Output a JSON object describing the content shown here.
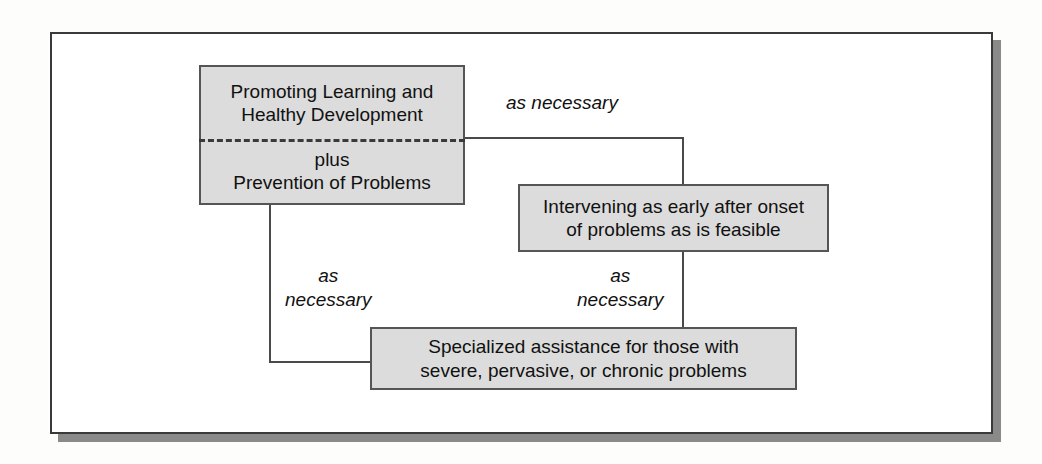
{
  "diagram": {
    "type": "flow-diagram",
    "title": "",
    "nodes": [
      {
        "id": "promoting-learning",
        "upper_lines": [
          "Promoting Learning and",
          "Healthy Development"
        ],
        "lower_lines": [
          "plus",
          "Prevention of Problems"
        ],
        "divider": "dashed"
      },
      {
        "id": "intervening-early",
        "lines": [
          "Intervening as early after onset",
          "of problems as is feasible"
        ]
      },
      {
        "id": "specialized-assistance",
        "lines": [
          "Specialized assistance for those with",
          "severe, pervasive, or chronic problems"
        ]
      }
    ],
    "edge_labels": [
      {
        "id": "top-right",
        "lines": [
          "as necessary"
        ]
      },
      {
        "id": "left",
        "lines": [
          "as",
          "necessary"
        ]
      },
      {
        "id": "middle",
        "lines": [
          "as",
          "necessary"
        ]
      }
    ],
    "colors": {
      "node_fill": "#dcdcdc",
      "node_border": "#555555",
      "line": "#4a4a4a",
      "frame": "#3a3a3a",
      "shadow": "#8a8a8a",
      "background": "#ffffff",
      "text": "#111111"
    }
  }
}
